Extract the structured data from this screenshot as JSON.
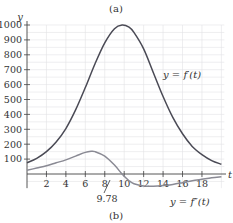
{
  "caption_top": "(a)",
  "caption_bottom": "(b)",
  "chart_data": {
    "type": "line",
    "title": "",
    "xlabel": "t",
    "ylabel": "y",
    "xlim": [
      0,
      20
    ],
    "ylim": [
      -80,
      1050
    ],
    "grid": true,
    "x_ticks": [
      2,
      4,
      6,
      8,
      10,
      12,
      14,
      16,
      18
    ],
    "x_tick_labels": [
      "2",
      "4",
      "6",
      "8",
      "10",
      "12",
      "14",
      "16",
      "18"
    ],
    "y_ticks": [
      100,
      200,
      300,
      400,
      500,
      600,
      700,
      800,
      900,
      1000
    ],
    "y_tick_labels": [
      "100",
      "200",
      "300",
      "400",
      "500",
      "600",
      "700",
      "800",
      "900",
      "1000"
    ],
    "annotations": [
      {
        "text": "9.78",
        "x": 9.78,
        "y": 0,
        "note": "zero of f''(t), marked with leader line"
      }
    ],
    "series": [
      {
        "name": "y = f'(t)",
        "color": "#4a4a55",
        "x": [
          0,
          1,
          2,
          3,
          4,
          5,
          6,
          7,
          8,
          9,
          9.78,
          10.5,
          11,
          12,
          13,
          14,
          15,
          16,
          17,
          18,
          19,
          20
        ],
        "y": [
          75,
          105,
          150,
          215,
          305,
          430,
          580,
          740,
          880,
          975,
          1000,
          985,
          950,
          840,
          680,
          520,
          380,
          270,
          185,
          130,
          90,
          65
        ]
      },
      {
        "name": "y = f''(t)",
        "color": "#8a8a94",
        "x": [
          0,
          1,
          2,
          3,
          4,
          5,
          6,
          6.6,
          7,
          8,
          9,
          9.78,
          10.5,
          11,
          12,
          13,
          14,
          15,
          16,
          17,
          18,
          19,
          20
        ],
        "y": [
          25,
          40,
          55,
          75,
          95,
          120,
          145,
          152,
          150,
          120,
          60,
          0,
          -45,
          -65,
          -80,
          -82,
          -78,
          -70,
          -58,
          -45,
          -35,
          -25,
          -18
        ]
      }
    ]
  },
  "labels": {
    "f_prime": "y = f′(t)",
    "f_double_prime": "y = f″(t)",
    "zero_value": "9.78"
  }
}
